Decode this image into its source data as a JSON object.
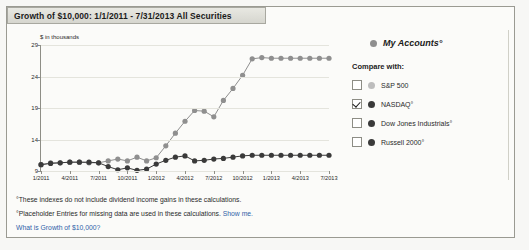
{
  "panel": {
    "title": "Growth of $10,000:  1/1/2011 - 7/31/2013  All Securities"
  },
  "legend": {
    "primary": {
      "label": "My Accounts°",
      "color": "#8f8f8f"
    },
    "compare_heading": "Compare with:",
    "items": [
      {
        "label": "S&P 500",
        "color": "#bdbdbd",
        "checked": false
      },
      {
        "label": "NASDAQ°",
        "color": "#3a3a3a",
        "checked": true
      },
      {
        "label": "Dow Jones Industrials°",
        "color": "#3a3a3a",
        "checked": false
      },
      {
        "label": "Russell 2000°",
        "color": "#3a3a3a",
        "checked": false
      }
    ]
  },
  "footnotes": {
    "line1": "°These indexes do not include dividend income gains in these calculations.",
    "line2": "°Placeholder Entries for missing data are used in these calculations.",
    "line2_link": "Show me.",
    "line3": "What is Growth of $10,000?"
  },
  "chart_data": {
    "type": "line",
    "title": "Growth of $10,000:  1/1/2011 - 7/31/2013  All Securities",
    "xlabel": "",
    "ylabel": "$ in thousands",
    "ylim": [
      9,
      29
    ],
    "yticks": [
      9,
      14,
      19,
      24,
      29
    ],
    "grid": true,
    "legend_position": "right",
    "xticks": [
      "1/2011",
      "4/2011",
      "7/2011",
      "10/2011",
      "1/2012",
      "4/2012",
      "7/2012",
      "10/2012",
      "1/2013",
      "4/2013",
      "7/2013"
    ],
    "x": [
      "1/2011",
      "2/2011",
      "3/2011",
      "4/2011",
      "5/2011",
      "6/2011",
      "7/2011",
      "8/2011",
      "9/2011",
      "10/2011",
      "11/2011",
      "12/2011",
      "1/2012",
      "2/2012",
      "3/2012",
      "4/2012",
      "5/2012",
      "6/2012",
      "7/2012",
      "8/2012",
      "9/2012",
      "10/2012",
      "11/2012",
      "12/2012",
      "1/2013",
      "2/2013",
      "3/2013",
      "4/2013",
      "5/2013",
      "6/2013",
      "7/2013"
    ],
    "series": [
      {
        "name": "My Accounts°",
        "color": "#8f8f8f",
        "values": [
          10.0,
          10.3,
          10.3,
          10.4,
          10.4,
          10.3,
          10.3,
          10.6,
          10.9,
          10.6,
          11.2,
          10.6,
          11.1,
          13.0,
          15.0,
          16.9,
          18.6,
          18.5,
          17.6,
          20.2,
          22.1,
          24.2,
          26.8,
          27.0,
          26.9,
          26.9,
          26.9,
          26.9,
          26.9,
          26.9,
          26.9
        ]
      },
      {
        "name": "NASDAQ°",
        "color": "#3a3a3a",
        "values": [
          10.0,
          10.2,
          10.3,
          10.4,
          10.4,
          10.4,
          10.3,
          9.7,
          9.2,
          9.5,
          9.1,
          9.3,
          10.1,
          10.7,
          11.2,
          11.4,
          10.6,
          10.7,
          10.9,
          11.0,
          11.2,
          11.4,
          11.5,
          11.5,
          11.5,
          11.5,
          11.5,
          11.5,
          11.5,
          11.5,
          11.5
        ]
      }
    ]
  }
}
